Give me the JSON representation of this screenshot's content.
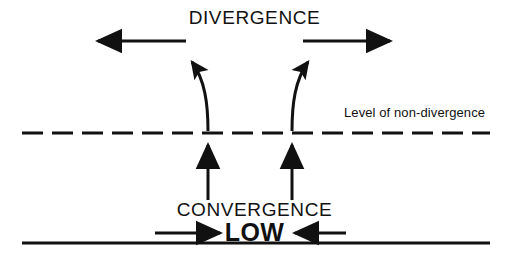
{
  "diagram": {
    "background_color": "#ffffff",
    "ink_color": "#111111",
    "labels": {
      "divergence": "DIVERGENCE",
      "convergence": "CONVERGENCE",
      "low": "LOW",
      "level_of_non_divergence": "Level of non-divergence"
    },
    "lines": {
      "level_of_non_divergence": {
        "style": "dashed",
        "x_start": 22,
        "x_end": 490,
        "y": 133,
        "stroke_width": 3,
        "dash_length": 21,
        "gap_length": 9
      },
      "surface": {
        "style": "solid",
        "x_start": 22,
        "x_end": 490,
        "y": 243,
        "stroke_width": 3
      }
    },
    "arrows": [
      {
        "name": "divergence-arrow-left",
        "kind": "straight",
        "direction": "left",
        "x_start": 186,
        "x_end": 92,
        "y": 41
      },
      {
        "name": "divergence-arrow-right",
        "kind": "straight",
        "direction": "right",
        "x_start": 303,
        "x_end": 396,
        "y": 41
      },
      {
        "name": "outflow-curve-left",
        "kind": "curved",
        "direction": "up-left",
        "x_start": 208,
        "y_start": 130,
        "x_end": 186,
        "y_end": 54
      },
      {
        "name": "outflow-curve-right",
        "kind": "curved",
        "direction": "up-right",
        "x_start": 292,
        "y_start": 130,
        "x_end": 314,
        "y_end": 54
      },
      {
        "name": "convergence-uparrow-left",
        "kind": "straight",
        "direction": "up",
        "x": 208,
        "y_start": 200,
        "y_end": 138
      },
      {
        "name": "convergence-uparrow-right",
        "kind": "straight",
        "direction": "up",
        "x": 292,
        "y_start": 200,
        "y_end": 138
      },
      {
        "name": "inflow-arrow-left",
        "kind": "straight",
        "direction": "right",
        "x_start": 155,
        "x_end": 226,
        "y": 233
      },
      {
        "name": "inflow-arrow-right",
        "kind": "straight",
        "direction": "left",
        "x_start": 346,
        "x_end": 289,
        "y": 233
      }
    ]
  }
}
